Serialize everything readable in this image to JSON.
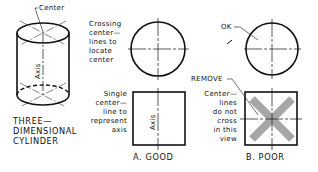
{
  "figure": {
    "type": "technical-drawing",
    "cylinder": {
      "center_label": "Center",
      "axis_label": "Axis",
      "caption_lines": [
        "THREE—",
        "DIMENSIONAL",
        "CYLINDER"
      ]
    },
    "good": {
      "circle_note_lines": [
        "Crossing",
        "center—",
        "lines to",
        "locate",
        "center"
      ],
      "square_note_lines": [
        "Single",
        "center—",
        "line to",
        "represent",
        "axis"
      ],
      "axis_label": "Axis",
      "caption": "A.  GOOD"
    },
    "poor": {
      "ok_label": "OK",
      "remove_label": "REMOVE",
      "square_note_lines": [
        "Center—",
        "lines",
        "do not",
        "cross",
        "in this",
        "view"
      ],
      "caption": "B.  POOR"
    },
    "colors": {
      "line": "#111111",
      "remove_x": "#a6a6a6"
    }
  }
}
